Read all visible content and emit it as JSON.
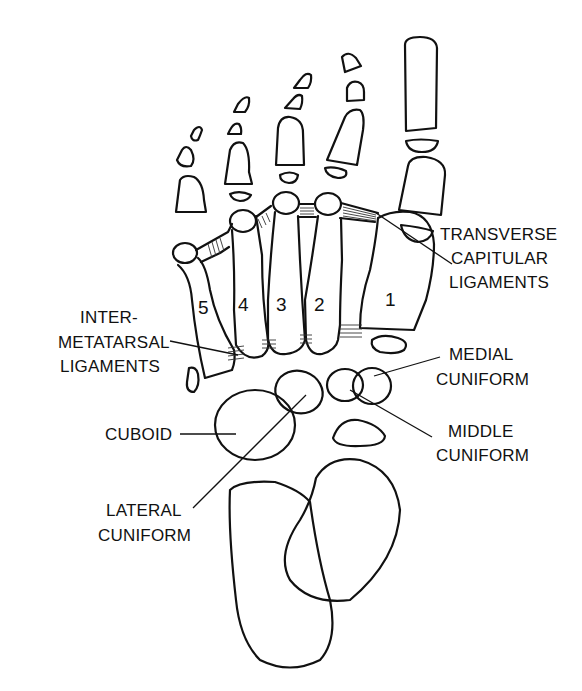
{
  "diagram": {
    "metatarsal_numbers": [
      "1",
      "2",
      "3",
      "4",
      "5"
    ],
    "labels": {
      "transverse": [
        "TRANSVERSE",
        "CAPITULAR",
        "LIGAMENTS"
      ],
      "intermetatarsal": [
        "INTER-",
        "METATARSAL",
        "LIGAMENTS"
      ],
      "medial_cuniform": [
        "MEDIAL",
        "CUNIFORM"
      ],
      "middle_cuniform": [
        "MIDDLE",
        "CUNIFORM"
      ],
      "cuboid": [
        "CUBOID"
      ],
      "lateral_cuniform": [
        "LATERAL",
        "CUNIFORM"
      ]
    },
    "colors": {
      "line": "#111111",
      "background": "#ffffff"
    }
  }
}
